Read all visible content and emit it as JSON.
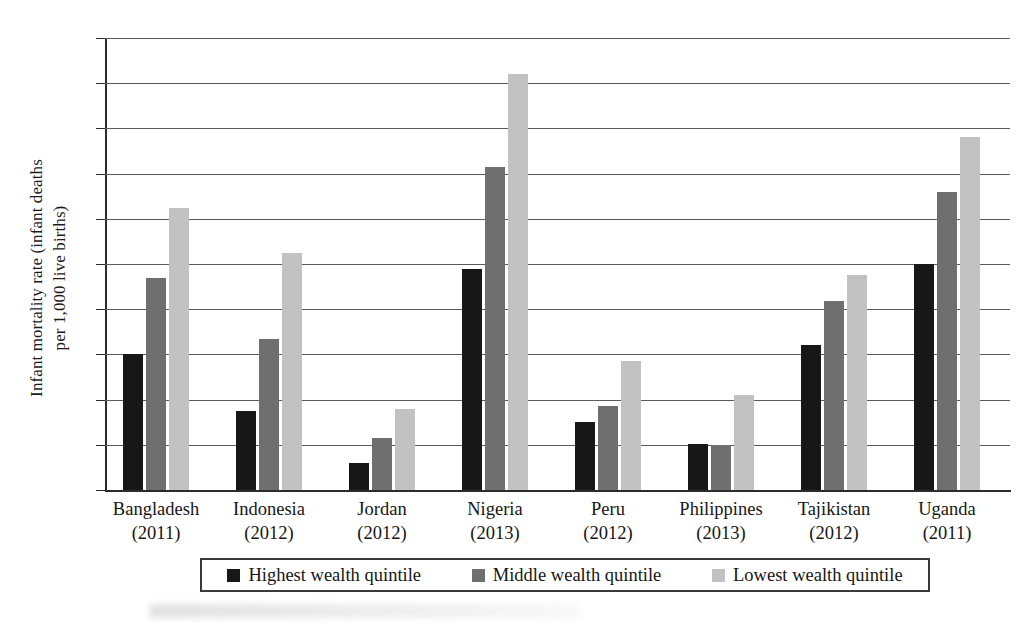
{
  "chart_data": {
    "type": "bar",
    "title": "",
    "xlabel": "",
    "ylabel": "Infant mortality rate (infant deaths\nper 1,000 live births)",
    "ylim": [
      0,
      100
    ],
    "ytick_step": 10,
    "yticks": [
      100,
      90,
      80,
      70,
      60,
      50,
      40,
      30,
      20,
      10,
      0
    ],
    "grid": true,
    "legend_position": "bottom",
    "categories": [
      "Bangladesh",
      "Indonesia",
      "Jordan",
      "Nigeria",
      "Peru",
      "Philippines",
      "Tajikistan",
      "Uganda"
    ],
    "category_years": [
      "(2011)",
      "(2012)",
      "(2012)",
      "(2013)",
      "(2012)",
      "(2013)",
      "(2012)",
      "(2011)"
    ],
    "series": [
      {
        "name": "Highest wealth quintile",
        "color": "#171717",
        "values": [
          30,
          17.5,
          6,
          48.8,
          15,
          10.2,
          32,
          50
        ]
      },
      {
        "name": "Middle wealth quintile",
        "color": "#6f6f6f",
        "values": [
          46.8,
          33.5,
          11.5,
          71.4,
          18.5,
          10,
          41.8,
          66
        ]
      },
      {
        "name": "Lowest wealth quintile",
        "color": "#c2c2c2",
        "values": [
          62.5,
          52.5,
          18,
          92,
          28.5,
          21,
          47.5,
          78
        ]
      }
    ]
  },
  "layout": {
    "plot_left": 105,
    "plot_top": 38,
    "plot_width": 905,
    "plot_height": 452,
    "group_start": 18,
    "group_pitch": 113,
    "bar_width": 20,
    "bar_gap": 3
  }
}
